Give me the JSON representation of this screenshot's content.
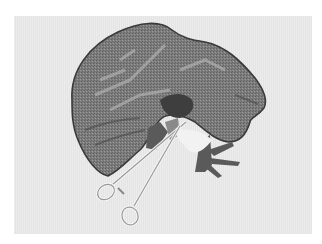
{
  "image": {
    "subject": "3D rendering of liver with surgical forceps",
    "background_color": "#ffffff",
    "panel_color": "#e8e8e8",
    "colors": {
      "liver_fill": "#7a7a7a",
      "liver_outline": "#3a3a3a",
      "vessel_dark": "#555555",
      "vessel_light": "#a8a8a8",
      "forceps": "#f4f4f4",
      "forceps_outline": "#9a9a9a"
    }
  }
}
